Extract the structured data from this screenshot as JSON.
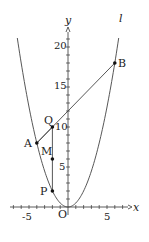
{
  "diagram": {
    "type": "coordinate-geometry",
    "axes": {
      "x_label": "x",
      "y_label": "y",
      "origin_label": "O",
      "x_ticks": [
        "-5",
        "5"
      ],
      "y_ticks": [
        "5",
        "10",
        "15",
        "20"
      ],
      "x_range": [
        -7,
        8
      ],
      "y_range": [
        -1,
        22
      ]
    },
    "curve": {
      "name": "parabola",
      "equation": "y = x^2/2"
    },
    "line": {
      "label": "l",
      "equation": "y = x + 12"
    },
    "points": {
      "A": {
        "label": "A",
        "x": -4,
        "y": 8
      },
      "B": {
        "label": "B",
        "x": 6,
        "y": 18
      },
      "Q": {
        "label": "Q",
        "x": -2,
        "y": 10
      },
      "M": {
        "label": "M",
        "x": -2,
        "y": 6
      },
      "P": {
        "label": "P",
        "x": -2,
        "y": 2
      }
    },
    "colors": {
      "stroke": "#333333",
      "point": "#111111"
    }
  }
}
